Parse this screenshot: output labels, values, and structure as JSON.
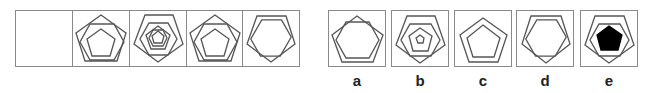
{
  "puzzle": {
    "type": "figure-sequence",
    "sequence": {
      "cells": [
        {
          "index": 1,
          "content": "blank",
          "shapes": []
        },
        {
          "index": 2,
          "shapes": [
            "pentagon",
            "hexagon",
            "pentagon"
          ]
        },
        {
          "index": 3,
          "shapes": [
            "pentagon",
            "hexagon",
            "pentagon",
            "hexagon"
          ]
        },
        {
          "index": 4,
          "shapes": [
            "pentagon",
            "hexagon",
            "pentagon"
          ]
        },
        {
          "index": 5,
          "shapes": [
            "pentagon",
            "hexagon"
          ]
        }
      ]
    },
    "options": [
      {
        "label": "a",
        "shapes": [
          "pentagon",
          "hexagon"
        ]
      },
      {
        "label": "b",
        "shapes": [
          "pentagon",
          "hexagon",
          "pentagon",
          "hexagon-small"
        ]
      },
      {
        "label": "c",
        "shapes": [
          "pentagon",
          "pentagon"
        ]
      },
      {
        "label": "d",
        "shapes": [
          "pentagon",
          "hexagon"
        ]
      },
      {
        "label": "e",
        "shapes": [
          "pentagon",
          "hexagon",
          "pentagon-filled"
        ]
      }
    ],
    "colors": {
      "line": "#555555",
      "border": "#8a8a8a",
      "fill": "#000000",
      "background": "#ffffff"
    }
  }
}
